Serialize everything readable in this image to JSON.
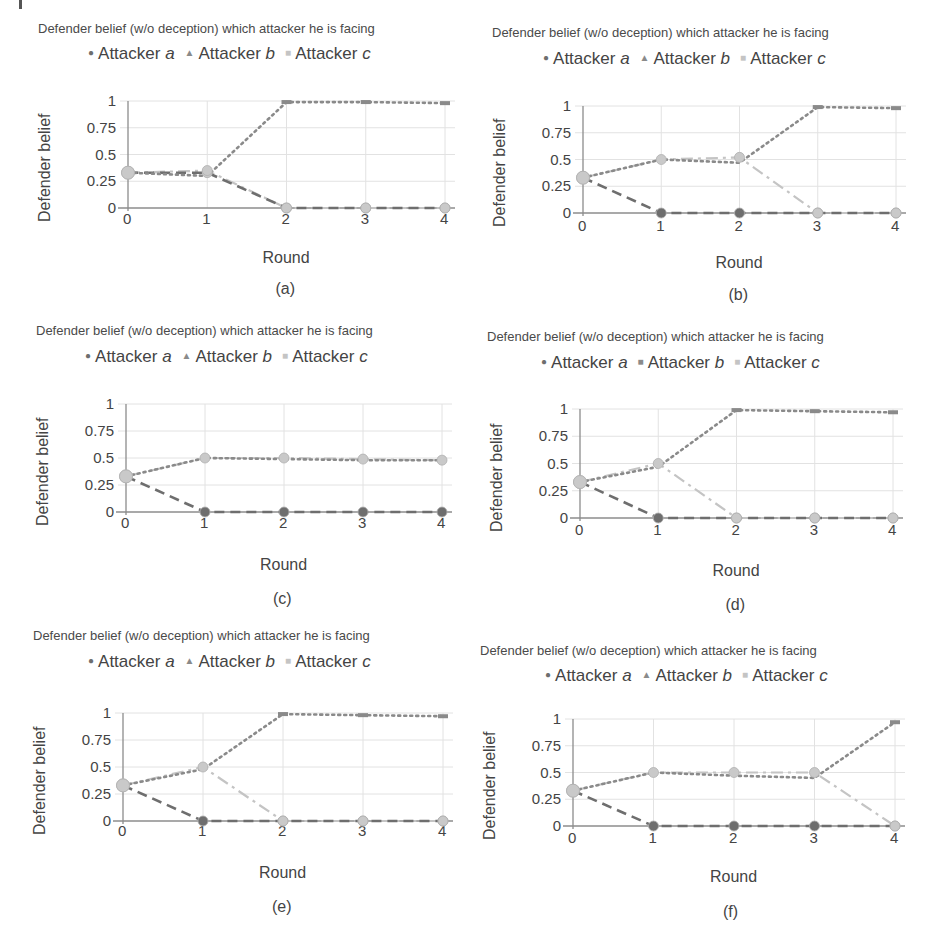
{
  "figure": {
    "series_names": [
      "Attacker a",
      "Attacker b",
      "Attacker c"
    ],
    "series_label_prefix": "Attacker",
    "series_letters": [
      "a",
      "b",
      "c"
    ],
    "colors": {
      "a": "#6e6e6e",
      "b": "#8a8a8a",
      "c": "#c4c4c4",
      "grid": "#e2e2e2",
      "axis": "#8c8c8c"
    }
  },
  "chart_data": [
    {
      "id": "a",
      "caption": "(a)",
      "type": "line",
      "title": "Defender belief (w/o deception) which attacker he is facing",
      "xlabel": "Round",
      "ylabel": "Defender belief",
      "categories": [
        0,
        1,
        2,
        3,
        4
      ],
      "yticks": [
        "1",
        "0.75",
        "0.5",
        "0.25",
        "0"
      ],
      "ylim": [
        0,
        1
      ],
      "legend_markers": [
        "●",
        "▲",
        "■"
      ],
      "legend_position": "top",
      "grid": true,
      "series": [
        {
          "name": "Attacker a",
          "values": [
            0.33,
            0.33,
            0,
            0,
            0
          ]
        },
        {
          "name": "Attacker b",
          "values": [
            0.33,
            0.3,
            0.99,
            0.99,
            0.98
          ]
        },
        {
          "name": "Attacker c",
          "values": [
            0.33,
            0.35,
            0,
            0,
            0
          ]
        }
      ]
    },
    {
      "id": "b",
      "caption": "(b)",
      "type": "line",
      "title": "Defender belief (w/o deception) which attacker he is facing",
      "xlabel": "Round",
      "ylabel": "Defender belief",
      "categories": [
        0,
        1,
        2,
        3,
        4
      ],
      "yticks": [
        "1",
        "0.75",
        "0.5",
        "0.25",
        "0"
      ],
      "ylim": [
        0,
        1
      ],
      "legend_markers": [
        "●",
        "▲",
        "■"
      ],
      "legend_position": "top",
      "grid": true,
      "series": [
        {
          "name": "Attacker a",
          "values": [
            0.33,
            0,
            0,
            0,
            0
          ]
        },
        {
          "name": "Attacker b",
          "values": [
            0.33,
            0.5,
            0.47,
            0.99,
            0.98
          ]
        },
        {
          "name": "Attacker c",
          "values": [
            0.33,
            0.5,
            0.52,
            0,
            0
          ]
        }
      ]
    },
    {
      "id": "c",
      "caption": "(c)",
      "type": "line",
      "title": "Defender belief (w/o deception) which attacker he is facing",
      "xlabel": "Round",
      "ylabel": "Defender belief",
      "categories": [
        0,
        1,
        2,
        3,
        4
      ],
      "yticks": [
        "1",
        "0.75",
        "0.5",
        "0.25",
        "0"
      ],
      "ylim": [
        0,
        1
      ],
      "legend_markers": [
        "●",
        "▲",
        "■"
      ],
      "legend_position": "top",
      "grid": true,
      "series": [
        {
          "name": "Attacker a",
          "values": [
            0.33,
            0,
            0,
            0,
            0
          ]
        },
        {
          "name": "Attacker b",
          "values": [
            0.33,
            0.5,
            0.49,
            0.48,
            0.48
          ]
        },
        {
          "name": "Attacker c",
          "values": [
            0.33,
            0.5,
            0.5,
            0.49,
            0.48
          ]
        }
      ]
    },
    {
      "id": "d",
      "caption": "(d)",
      "type": "line",
      "title": "Defender belief (w/o deception) which attacker he is facing",
      "xlabel": "Round",
      "ylabel": "Defender belief",
      "categories": [
        0,
        1,
        2,
        3,
        4
      ],
      "yticks": [
        "1",
        "0.75",
        "0.5",
        "0.25",
        "0"
      ],
      "ylim": [
        0,
        1
      ],
      "legend_markers": [
        "●",
        "■",
        "■"
      ],
      "legend_position": "top",
      "grid": true,
      "series": [
        {
          "name": "Attacker a",
          "values": [
            0.33,
            0,
            0,
            0,
            0
          ]
        },
        {
          "name": "Attacker b",
          "values": [
            0.33,
            0.47,
            0.99,
            0.98,
            0.97
          ]
        },
        {
          "name": "Attacker c",
          "values": [
            0.33,
            0.5,
            0,
            0,
            0
          ]
        }
      ]
    },
    {
      "id": "e",
      "caption": "(e)",
      "type": "line",
      "title": "Defender belief (w/o deception) which attacker he is facing",
      "xlabel": "Round",
      "ylabel": "Defender belief",
      "categories": [
        0,
        1,
        2,
        3,
        4
      ],
      "yticks": [
        "1",
        "0.75",
        "0.5",
        "0.25",
        "0"
      ],
      "ylim": [
        0,
        1
      ],
      "legend_markers": [
        "●",
        "▲",
        "■"
      ],
      "legend_position": "top",
      "grid": true,
      "series": [
        {
          "name": "Attacker a",
          "values": [
            0.33,
            0,
            0,
            0,
            0
          ]
        },
        {
          "name": "Attacker b",
          "values": [
            0.33,
            0.48,
            0.99,
            0.98,
            0.97
          ]
        },
        {
          "name": "Attacker c",
          "values": [
            0.33,
            0.5,
            0,
            0,
            0
          ]
        }
      ]
    },
    {
      "id": "f",
      "caption": "(f)",
      "type": "line",
      "title": "Defender belief (w/o deception) which attacker he is facing",
      "xlabel": "Round",
      "ylabel": "Defender belief",
      "categories": [
        0,
        1,
        2,
        3,
        4
      ],
      "yticks": [
        "1",
        "0.75",
        "0.5",
        "0.25",
        "0"
      ],
      "ylim": [
        0,
        1
      ],
      "legend_markers": [
        "●",
        "▲",
        "■"
      ],
      "legend_position": "top",
      "grid": true,
      "series": [
        {
          "name": "Attacker a",
          "values": [
            0.33,
            0,
            0,
            0,
            0
          ]
        },
        {
          "name": "Attacker b",
          "values": [
            0.33,
            0.5,
            0.47,
            0.45,
            0.97
          ]
        },
        {
          "name": "Attacker c",
          "values": [
            0.33,
            0.5,
            0.5,
            0.5,
            0
          ]
        }
      ]
    }
  ],
  "layout": {
    "panels": [
      {
        "left": 0,
        "top": 0,
        "title_x": 38,
        "title_y": 34,
        "legend_x": 88,
        "legend_y": 62,
        "plot_x": 128,
        "plot_y": 101,
        "plot_w": 317,
        "plot_h": 107,
        "xtick_y": 219,
        "xlabel_y": 259,
        "caption_y": 290
      },
      {
        "left": 0,
        "top": 0,
        "title_x": 492,
        "title_y": 38,
        "legend_x": 543,
        "legend_y": 67,
        "plot_x": 583,
        "plot_y": 106,
        "plot_w": 313,
        "plot_h": 107,
        "xtick_y": 226,
        "xlabel_y": 264,
        "caption_y": 296
      },
      {
        "left": 0,
        "top": 0,
        "title_x": 36,
        "title_y": 336,
        "legend_x": 85,
        "legend_y": 365,
        "plot_x": 126,
        "plot_y": 404,
        "plot_w": 316,
        "plot_h": 108,
        "xtick_y": 523,
        "xlabel_y": 566,
        "caption_y": 600
      },
      {
        "left": 0,
        "top": 0,
        "title_x": 487,
        "title_y": 342,
        "legend_x": 541,
        "legend_y": 371,
        "plot_x": 580,
        "plot_y": 409,
        "plot_w": 313,
        "plot_h": 109,
        "xtick_y": 530,
        "xlabel_y": 572,
        "caption_y": 606
      },
      {
        "left": 0,
        "top": 0,
        "title_x": 33,
        "title_y": 641,
        "legend_x": 88,
        "legend_y": 670,
        "plot_x": 123,
        "plot_y": 713,
        "plot_w": 320,
        "plot_h": 108,
        "xtick_y": 831,
        "xlabel_y": 874,
        "caption_y": 908
      },
      {
        "left": 0,
        "top": 0,
        "title_x": 480,
        "title_y": 656,
        "legend_x": 545,
        "legend_y": 684,
        "plot_x": 573,
        "plot_y": 719,
        "plot_w": 322,
        "plot_h": 107,
        "xtick_y": 838,
        "xlabel_y": 878,
        "caption_y": 913
      }
    ]
  }
}
